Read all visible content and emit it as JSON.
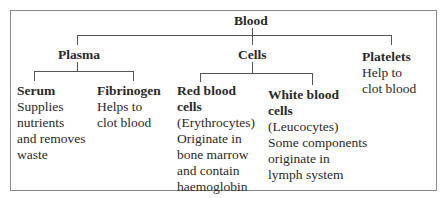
{
  "diagram": {
    "root": {
      "label": "Blood"
    },
    "categories": [
      {
        "label": "Plasma",
        "children": [
          {
            "label": "Serum",
            "description": [
              "Supplies",
              "nutrients",
              "and removes",
              "waste"
            ]
          },
          {
            "label": "Fibrinogen",
            "description": [
              "Helps to",
              "clot blood"
            ]
          }
        ]
      },
      {
        "label": "Cells",
        "children": [
          {
            "label_lines": [
              "Red blood",
              "cells"
            ],
            "description": [
              "(Erythrocytes)",
              "Originate in",
              "bone marrow",
              "and contain",
              "haemoglobin"
            ]
          },
          {
            "label_lines": [
              "White blood",
              "cells"
            ],
            "description": [
              "(Leucocytes)",
              "Some components",
              "originate in",
              "lymph system"
            ]
          }
        ]
      },
      {
        "label": "Platelets",
        "description": [
          "Help to",
          "clot blood"
        ]
      }
    ]
  }
}
